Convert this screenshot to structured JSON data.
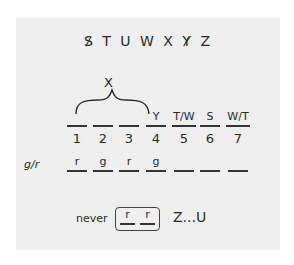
{
  "alphabet": {
    "letters": [
      {
        "char": "S",
        "crossed": true
      },
      {
        "char": "T",
        "crossed": false
      },
      {
        "char": "U",
        "crossed": false
      },
      {
        "char": "W",
        "crossed": false
      },
      {
        "char": "X",
        "crossed": false
      },
      {
        "char": "Y",
        "crossed": true
      },
      {
        "char": "Z",
        "crossed": false
      }
    ]
  },
  "brace_label": "X",
  "positions": {
    "numbers": [
      "1",
      "2",
      "3",
      "4",
      "5",
      "6",
      "7"
    ],
    "letter_slots": [
      "",
      "",
      "",
      "Y",
      "T/W",
      "S",
      "W/T"
    ]
  },
  "color_row": {
    "label": "g/r",
    "slots": [
      "r",
      "g",
      "r",
      "g",
      "",
      "",
      ""
    ]
  },
  "rule": {
    "prefix": "never",
    "boxed": [
      "r",
      "r"
    ],
    "suffix": "Z...U"
  }
}
